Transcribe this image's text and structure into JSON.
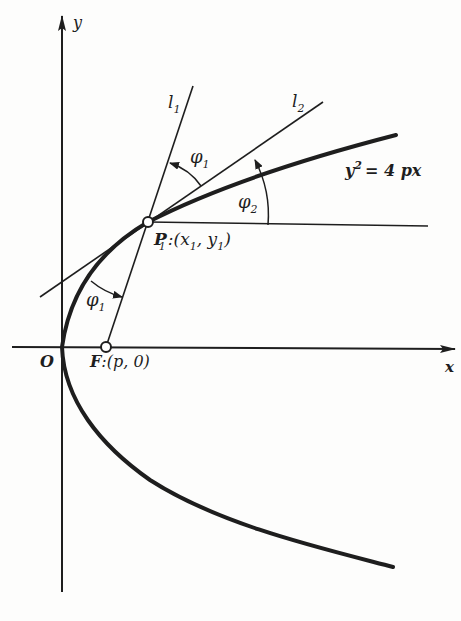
{
  "figure": {
    "equation": "y² = 4 px",
    "equation_base": "y",
    "equation_sup": "2",
    "equation_rest": "= 4 px",
    "axes": {
      "x_label": "x",
      "y_label": "y",
      "origin_label": "O"
    },
    "points": {
      "focus": {
        "name": "F",
        "coords": ":(p, 0)"
      },
      "point": {
        "name": "P",
        "sub": "1",
        "coords": ":(x",
        "coords_sub1": "1",
        "coords_mid": ", y",
        "coords_sub2": "1",
        "coords_end": ")"
      }
    },
    "lines": {
      "l1": {
        "base": "l",
        "sub": "1"
      },
      "l2": {
        "base": "l",
        "sub": "2"
      }
    },
    "angles": {
      "phi1_top": {
        "base": "φ",
        "sub": "1"
      },
      "phi2": {
        "base": "φ",
        "sub": "2"
      },
      "phi1_left": {
        "base": "φ",
        "sub": "1"
      }
    }
  },
  "colors": {
    "ink": "#1e1e1e",
    "background": "#fdfdfc"
  }
}
